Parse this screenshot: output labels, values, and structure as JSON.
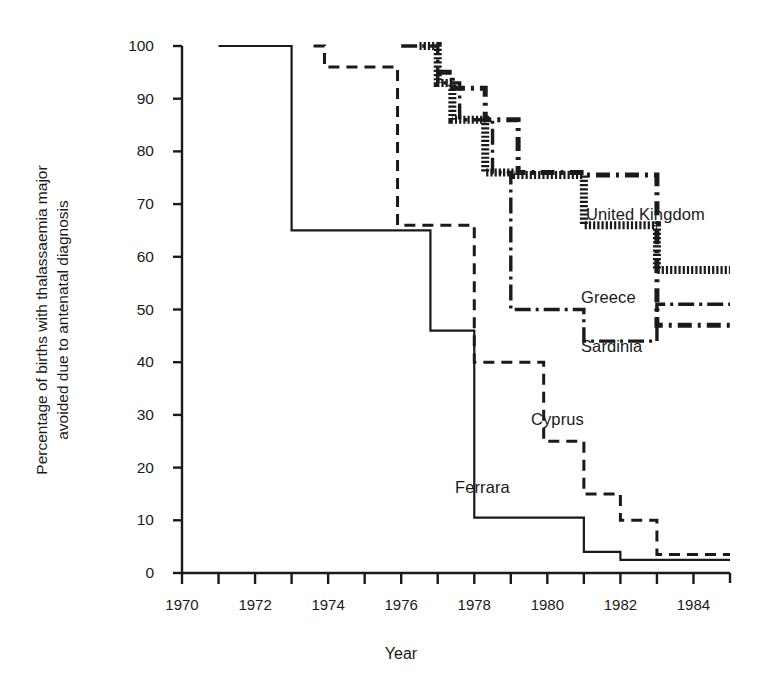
{
  "figure": {
    "title": "",
    "xlabel": "Year",
    "ylabel_line1": "Percentage of births with thalassaemia major",
    "ylabel_line2": "avoided due to antenatal diagnosis"
  },
  "axes": {
    "y_ticks": [
      "100",
      "90",
      "80",
      "70",
      "60",
      "50",
      "40",
      "30",
      "20",
      "10",
      "0"
    ],
    "x_ticks_labeled": [
      "1970",
      "1972",
      "1974",
      "1976",
      "1978",
      "1980",
      "1982",
      "1984"
    ]
  },
  "series_labels": {
    "united_kingdom": "United Kingdom",
    "greece": "Greece",
    "sardinia": "Sardinia",
    "cyprus": "Cyprus",
    "ferrara": "Ferrara"
  },
  "colors": {
    "ink": "#1a1a1a",
    "background": "#ffffff"
  },
  "chart_data": {
    "type": "line",
    "title": "",
    "xlabel": "Year",
    "ylabel": "Percentage of births with thalassaemia major avoided due to antenatal diagnosis",
    "xlim": [
      1970,
      1985
    ],
    "ylim": [
      0,
      100
    ],
    "x_tick_step": 1,
    "x_label_step": 2,
    "y_tick_step": 10,
    "grid": false,
    "legend": "inline-annotations",
    "step_style": "post",
    "series": [
      {
        "name": "Ferrara",
        "style": "solid-thin",
        "x": [
          1971.0,
          1973.0,
          1973.0,
          1976.8,
          1976.8,
          1978.0,
          1978.0,
          1981.0,
          1981.0,
          1982.0,
          1982.0,
          1985.0
        ],
        "y": [
          100,
          100,
          65,
          65,
          46,
          46,
          10.5,
          10.5,
          4,
          4,
          2.5,
          2.5
        ]
      },
      {
        "name": "Cyprus",
        "style": "dashed",
        "x": [
          1973.6,
          1973.9,
          1973.9,
          1975.9,
          1975.9,
          1978.0,
          1978.0,
          1979.9,
          1979.9,
          1981.0,
          1981.0,
          1982.0,
          1982.0,
          1983.0,
          1983.0,
          1985.0
        ],
        "y": [
          100,
          100,
          96,
          96,
          66,
          66,
          40,
          40,
          25,
          25,
          15,
          15,
          10,
          10,
          3.5,
          3.5
        ]
      },
      {
        "name": "United Kingdom",
        "style": "thick-hatched",
        "x": [
          1976.5,
          1977.0,
          1977.0,
          1977.4,
          1977.4,
          1978.3,
          1978.3,
          1979.1,
          1979.1,
          1981.0,
          1981.0,
          1983.0,
          1983.0,
          1985.0
        ],
        "y": [
          100,
          100,
          93,
          93,
          86,
          86,
          76,
          76,
          75.5,
          75.5,
          66,
          66,
          57.5,
          57.5
        ]
      },
      {
        "name": "Greece",
        "style": "dash-dot",
        "x": [
          1976.0,
          1977.0,
          1977.0,
          1977.6,
          1977.6,
          1978.5,
          1978.5,
          1979.0,
          1979.0,
          1981.0,
          1981.0,
          1983.0,
          1983.0,
          1985.0
        ],
        "y": [
          100,
          100,
          93,
          93,
          86,
          86,
          76,
          76,
          50,
          50,
          44,
          44,
          51,
          51
        ]
      },
      {
        "name": "Sardinia",
        "style": "thick-dashed",
        "x": [
          1977.0,
          1977.4,
          1977.4,
          1978.3,
          1978.3,
          1979.2,
          1979.2,
          1981.0,
          1981.0,
          1983.0,
          1983.0,
          1985.0
        ],
        "y": [
          95,
          95,
          92,
          92,
          86,
          86,
          76,
          76,
          75.5,
          75.5,
          47,
          47
        ]
      }
    ]
  }
}
